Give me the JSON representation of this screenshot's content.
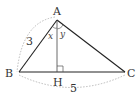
{
  "diagram": {
    "type": "right-triangle-altitude",
    "points": {
      "A": {
        "label": "A",
        "x": 57,
        "y": 20
      },
      "B": {
        "label": "B",
        "x": 19,
        "y": 72
      },
      "C": {
        "label": "C",
        "x": 125,
        "y": 72
      },
      "H": {
        "label": "H",
        "x": 57,
        "y": 72
      }
    },
    "lengths": {
      "AB": "3",
      "BC": "5"
    },
    "angles": {
      "BAH": "x",
      "HAC": "y"
    },
    "colors": {
      "line": "#222222",
      "dotted": "#999999",
      "text": "#333333"
    }
  }
}
